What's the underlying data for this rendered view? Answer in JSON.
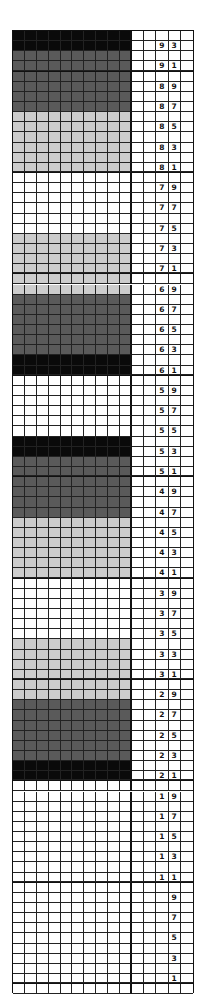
{
  "chart_data": {
    "type": "table",
    "title": "",
    "stitch_columns": 10,
    "label_columns": 5,
    "top_row": 94,
    "bottom_row": 0,
    "thick_line_every_rows": 10,
    "colors": {
      "black": "#0a0a0a",
      "dark_gray": "#5a5a5a",
      "light_gray": "#cccccc",
      "white": "#ffffff"
    },
    "bands": [
      {
        "rows": [
          93,
          94
        ],
        "color": "black"
      },
      {
        "rows": [
          87,
          92
        ],
        "color": "dark_gray"
      },
      {
        "rows": [
          81,
          86
        ],
        "color": "light_gray"
      },
      {
        "rows": [
          75,
          80
        ],
        "color": "white"
      },
      {
        "rows": [
          69,
          74
        ],
        "color": "light_gray"
      },
      {
        "rows": [
          63,
          68
        ],
        "color": "dark_gray"
      },
      {
        "rows": [
          61,
          62
        ],
        "color": "black"
      },
      {
        "rows": [
          55,
          60
        ],
        "color": "white"
      },
      {
        "rows": [
          53,
          54
        ],
        "color": "black"
      },
      {
        "rows": [
          47,
          52
        ],
        "color": "dark_gray"
      },
      {
        "rows": [
          41,
          46
        ],
        "color": "light_gray"
      },
      {
        "rows": [
          35,
          40
        ],
        "color": "white"
      },
      {
        "rows": [
          29,
          34
        ],
        "color": "light_gray"
      },
      {
        "rows": [
          23,
          28
        ],
        "color": "dark_gray"
      },
      {
        "rows": [
          21,
          22
        ],
        "color": "black"
      },
      {
        "rows": [
          0,
          20
        ],
        "color": "white"
      }
    ],
    "row_labels": [
      "93",
      "91",
      "89",
      "87",
      "85",
      "83",
      "81",
      "79",
      "77",
      "75",
      "73",
      "71",
      "69",
      "67",
      "65",
      "63",
      "61",
      "59",
      "57",
      "55",
      "53",
      "51",
      "49",
      "47",
      "45",
      "43",
      "41",
      "39",
      "37",
      "35",
      "33",
      "31",
      "29",
      "27",
      "25",
      "23",
      "21",
      "19",
      "17",
      "15",
      "13",
      "11",
      "9",
      "7",
      "5",
      "3",
      "1"
    ]
  }
}
